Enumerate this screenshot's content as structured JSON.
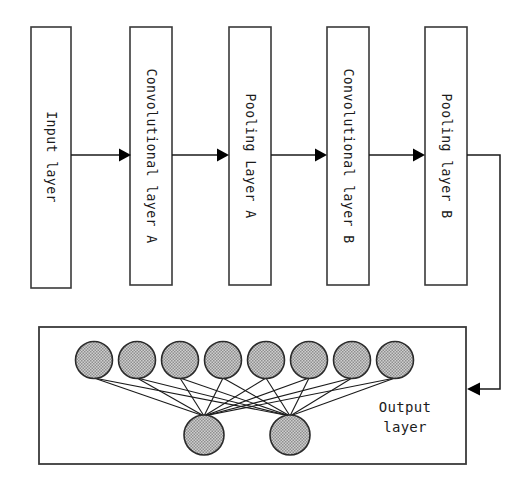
{
  "diagram": {
    "type": "flow-diagram",
    "background_color": "#ffffff",
    "stroke_color": "#3a3a3a",
    "neuron_fill_color": "#b0b0b0",
    "arrow_color": "#000000"
  },
  "pipeline": {
    "boxes": [
      {
        "id": "input-layer",
        "label": "Input layer",
        "x": 31,
        "y": 27,
        "w": 40,
        "h": 261
      },
      {
        "id": "conv-layer-a",
        "label": "Convolutional layer A",
        "x": 130,
        "y": 27,
        "w": 42,
        "h": 258
      },
      {
        "id": "pooling-layer-a",
        "label": "Pooling Layer A",
        "x": 229,
        "y": 27,
        "w": 42,
        "h": 258
      },
      {
        "id": "conv-layer-b",
        "label": "Convolutional layer B",
        "x": 327,
        "y": 27,
        "w": 42,
        "h": 258
      },
      {
        "id": "pooling-layer-b",
        "label": "Pooling layer B",
        "x": 425,
        "y": 27,
        "w": 42,
        "h": 258
      }
    ],
    "arrows": [
      {
        "id": "arrow-input-to-conv-a",
        "from": "input-layer",
        "to": "conv-layer-a",
        "x1": 71,
        "x2": 130,
        "y": 155
      },
      {
        "id": "arrow-conv-a-to-pool-a",
        "from": "conv-layer-a",
        "to": "pooling-layer-a",
        "x1": 172,
        "x2": 229,
        "y": 155
      },
      {
        "id": "arrow-pool-a-to-conv-b",
        "from": "pooling-layer-a",
        "to": "conv-layer-b",
        "x1": 271,
        "x2": 327,
        "y": 155
      },
      {
        "id": "arrow-conv-b-to-pool-b",
        "from": "conv-layer-b",
        "to": "pooling-layer-b",
        "x1": 369,
        "x2": 425,
        "y": 155
      }
    ],
    "feedback_connector": {
      "id": "connector-pool-b-to-output",
      "from": "pooling-layer-b",
      "to": "output-layer-box",
      "start_x": 467,
      "start_y": 155,
      "corner_x": 500,
      "end_y": 389,
      "end_x": 467
    }
  },
  "output_section": {
    "box": {
      "id": "output-layer-box",
      "x": 39,
      "y": 327,
      "w": 427,
      "h": 137
    },
    "label": "Output\nlayer",
    "label_line1": "Output",
    "label_line2": "layer",
    "label_x": 405,
    "label_y": 418,
    "network": {
      "type": "fully-connected",
      "hidden_nodes": {
        "count": 8,
        "radius": 18.5,
        "cy": 360,
        "cx": [
          94,
          137,
          180,
          223,
          266,
          309,
          352,
          395
        ]
      },
      "output_nodes": {
        "count": 2,
        "radius": 20,
        "cy": 435,
        "cx": [
          204,
          290
        ]
      }
    }
  }
}
